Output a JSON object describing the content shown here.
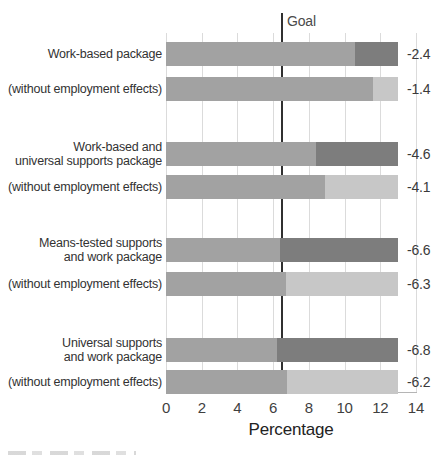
{
  "colors": {
    "bar_main": "#a2a2a2",
    "segment_dark": "#7d7d7d",
    "segment_light": "#c7c7c7",
    "gridline": "#dbdbdb",
    "axis_line": "#b5b5b5",
    "goal_line": "#303030"
  },
  "chart_data": {
    "type": "bar",
    "orientation": "horizontal",
    "title": "",
    "xlabel": "Percentage",
    "ylabel": "",
    "xlim": [
      0,
      14
    ],
    "xticks": [
      0,
      2,
      4,
      6,
      8,
      10,
      12,
      14
    ],
    "grid": "vertical gridlines at each x tick",
    "legend": "none",
    "goal_line": {
      "label": "Goal",
      "x": 6.5
    },
    "baseline_total_percent": 13.0,
    "rows": [
      {
        "label_lines": [
          "Work-based package"
        ],
        "value_label": "-2.4",
        "reduction": 2.4,
        "remaining": 10.6,
        "segment_style": "dark"
      },
      {
        "label_lines": [
          "(without employment effects)"
        ],
        "value_label": "-1.4",
        "reduction": 1.4,
        "remaining": 11.6,
        "segment_style": "light"
      },
      {
        "label_lines": [
          "Work-based and",
          "universal supports package"
        ],
        "value_label": "-4.6",
        "reduction": 4.6,
        "remaining": 8.4,
        "segment_style": "dark"
      },
      {
        "label_lines": [
          "(without employment effects)"
        ],
        "value_label": "-4.1",
        "reduction": 4.1,
        "remaining": 8.9,
        "segment_style": "light"
      },
      {
        "label_lines": [
          "Means-tested supports",
          "and work package"
        ],
        "value_label": "-6.6",
        "reduction": 6.6,
        "remaining": 6.4,
        "segment_style": "dark"
      },
      {
        "label_lines": [
          "(without employment effects)"
        ],
        "value_label": "-6.3",
        "reduction": 6.3,
        "remaining": 6.7,
        "segment_style": "light"
      },
      {
        "label_lines": [
          "Universal supports",
          "and work package"
        ],
        "value_label": "-6.8",
        "reduction": 6.8,
        "remaining": 6.2,
        "segment_style": "dark"
      },
      {
        "label_lines": [
          "(without employment effects)"
        ],
        "value_label": "-6.2",
        "reduction": 6.2,
        "remaining": 6.8,
        "segment_style": "light"
      }
    ]
  }
}
